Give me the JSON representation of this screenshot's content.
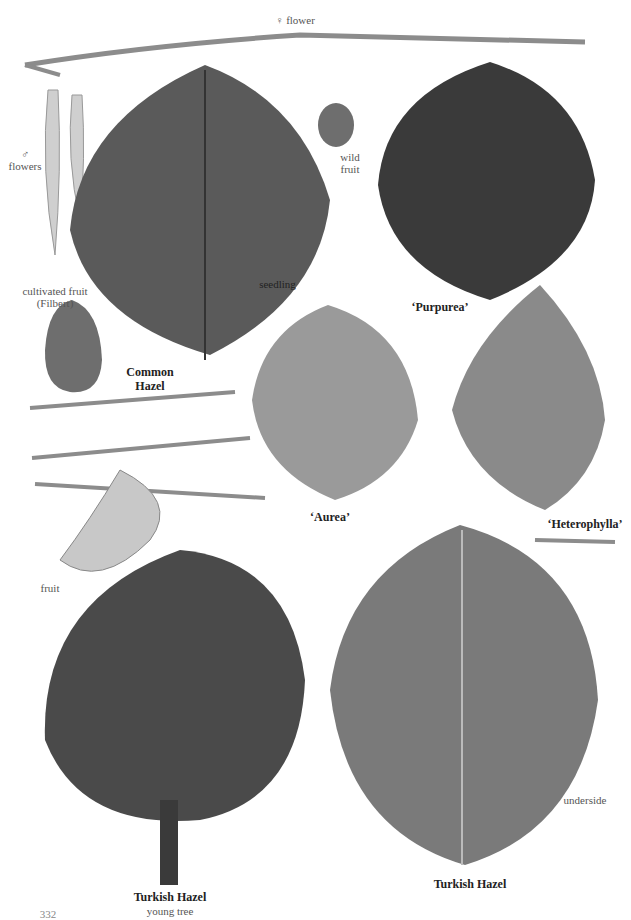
{
  "page": {
    "number": "332",
    "background": "#ffffff"
  },
  "labels": {
    "female_flower": "♀ flower",
    "male_flowers_symbol": "♂",
    "male_flowers": "flowers",
    "wild_fruit_1": "wild",
    "wild_fruit_2": "fruit",
    "cultivated_fruit_1": "cultivated fruit",
    "cultivated_fruit_2": "(Filbert)",
    "seedling": "seedling",
    "fruit": "fruit",
    "underside": "underside",
    "young_tree": "young tree"
  },
  "titles": {
    "common_hazel_1": "Common",
    "common_hazel_2": "Hazel",
    "purpurea": "‘Purpurea’",
    "aurea": "‘Aurea’",
    "heterophylla": "‘Heterophylla’",
    "turkish_hazel_tree": "Turkish Hazel",
    "turkish_hazel_leaf": "Turkish Hazel"
  },
  "colors": {
    "common_leaf": "#5a5a5a",
    "purpurea_leaf": "#3a3a3a",
    "aurea_leaf": "#9a9a9a",
    "heterophylla_leaf": "#8a8a8a",
    "turkish_leaf": "#7a7a7a",
    "tree_canopy": "#4a4a4a",
    "twig": "#8c8c8c",
    "catkin": "#cfcfcf",
    "nut": "#6e6e6e"
  }
}
